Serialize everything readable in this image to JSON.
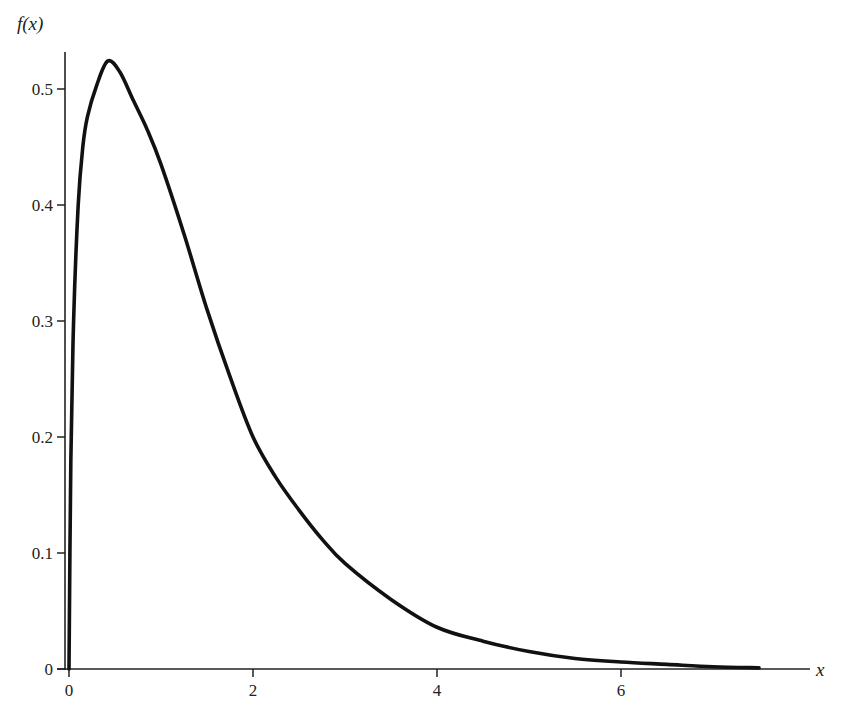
{
  "chart_data": {
    "type": "line",
    "title": "",
    "xlabel": "x",
    "ylabel": "f(x)",
    "xlim": [
      0,
      7.5
    ],
    "ylim": [
      0,
      0.53
    ],
    "grid": false,
    "legend": null,
    "x_ticks": [
      0,
      2,
      4,
      6
    ],
    "x_tick_labels": [
      "0",
      "2",
      "4",
      "6"
    ],
    "y_ticks": [
      0,
      0.1,
      0.2,
      0.3,
      0.4,
      0.5
    ],
    "y_tick_labels": [
      "0",
      "0.1",
      "0.2",
      "0.3",
      "0.4",
      "0.5"
    ],
    "series": [
      {
        "name": "f(x)",
        "color": "#111111",
        "x": [
          0,
          0.02,
          0.05,
          0.1,
          0.15,
          0.2,
          0.3,
          0.42,
          0.55,
          0.7,
          0.85,
          1.0,
          1.25,
          1.5,
          1.75,
          2.0,
          2.25,
          2.5,
          2.75,
          3.0,
          3.5,
          4.0,
          4.5,
          5.0,
          5.5,
          6.0,
          6.5,
          7.0,
          7.5
        ],
        "y": [
          0,
          0.18,
          0.3,
          0.4,
          0.45,
          0.476,
          0.503,
          0.524,
          0.515,
          0.49,
          0.465,
          0.435,
          0.375,
          0.31,
          0.252,
          0.2,
          0.165,
          0.137,
          0.112,
          0.091,
          0.06,
          0.036,
          0.024,
          0.015,
          0.009,
          0.006,
          0.004,
          0.002,
          0.001
        ]
      }
    ]
  }
}
